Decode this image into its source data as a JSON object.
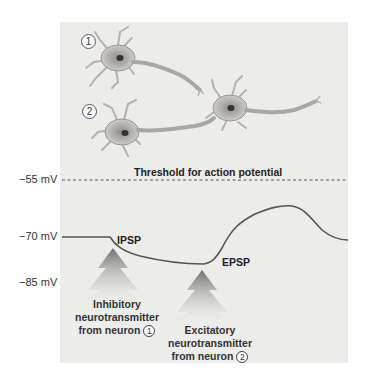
{
  "figure": {
    "threshold_label": "Threshold for action potential",
    "y_axis": {
      "ticks": [
        {
          "label": "−55 mV",
          "value": -55
        },
        {
          "label": "−70 mV",
          "value": -70
        },
        {
          "label": "−85 mV",
          "value": -85
        }
      ]
    },
    "neurons": [
      {
        "number": "1",
        "role": "presynaptic inhibitory neuron"
      },
      {
        "number": "2",
        "role": "presynaptic excitatory neuron"
      },
      {
        "number": "",
        "role": "postsynaptic neuron"
      }
    ],
    "annotations": {
      "ipsp": "IPSP",
      "epsp": "EPSP"
    },
    "captions": {
      "inhibitory": {
        "line1": "Inhibitory",
        "line2": "neurotransmitter",
        "line3": "from neuron",
        "num": "1"
      },
      "excitatory": {
        "line1": "Excitatory",
        "line2": "neurotransmitter",
        "line3": "from neuron",
        "num": "2"
      }
    },
    "colors": {
      "panel_bg": "#ececea",
      "trace": "#555555",
      "neuron_body": "#b8b6b3",
      "arrow": "#8a8a8a"
    }
  }
}
